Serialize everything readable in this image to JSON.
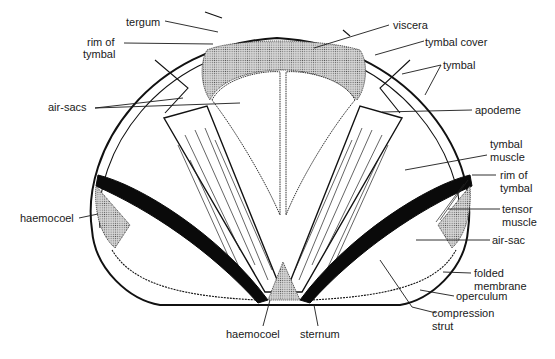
{
  "diagram": {
    "colors": {
      "ink": "#111111",
      "stipple": "#bdbdbd",
      "black_fill": "#0a0a0a",
      "background": "#ffffff"
    },
    "labels": {
      "tergum": "tergum",
      "rim_of_tymbal_top_1": "rim of",
      "rim_of_tymbal_top_2": "tymbal",
      "air_sacs": "air-sacs",
      "haemocoel_left": "haemocoel",
      "viscera": "viscera",
      "tymbal_cover": "tymbal cover",
      "tymbal": "tymbal",
      "apodeme": "apodeme",
      "tymbal_muscle_1": "tymbal",
      "tymbal_muscle_2": "muscle",
      "rim_of_tymbal_right_1": "rim of",
      "rim_of_tymbal_right_2": "tymbal",
      "tensor_muscle_1": "tensor",
      "tensor_muscle_2": "muscle",
      "air_sac": "air-sac",
      "folded_membrane_1": "folded",
      "folded_membrane_2": "membrane",
      "operculum": "operculum",
      "compression_strut_1": "compression",
      "compression_strut_2": "strut",
      "haemocoel_bottom": "haemocoel",
      "sternum": "sternum"
    }
  }
}
